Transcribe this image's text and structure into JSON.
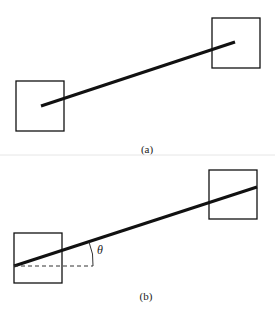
{
  "colors": {
    "stroke": "#111111",
    "background": "#ffffff",
    "separator": "#e6e6e6"
  },
  "panels": [
    {
      "id": "a",
      "caption": "(a)",
      "boxes": [
        {
          "x": 16,
          "y": 81,
          "w": 48,
          "h": 50
        },
        {
          "x": 212,
          "y": 18,
          "w": 48,
          "h": 50
        }
      ],
      "bar": {
        "x1": 41,
        "y1": 106,
        "x2": 235,
        "y2": 42
      }
    },
    {
      "id": "b",
      "caption": "(b)",
      "boxes": [
        {
          "x": 14,
          "y": 233,
          "w": 48,
          "h": 50
        },
        {
          "x": 209,
          "y": 170,
          "w": 48,
          "h": 49
        }
      ],
      "bar": {
        "x1": 14,
        "y1": 266,
        "x2": 257,
        "y2": 187
      },
      "reference_line": {
        "x1": 14,
        "y1": 266,
        "x2": 93,
        "y2": 266,
        "style": "dashed"
      },
      "angle_label": "θ"
    }
  ]
}
